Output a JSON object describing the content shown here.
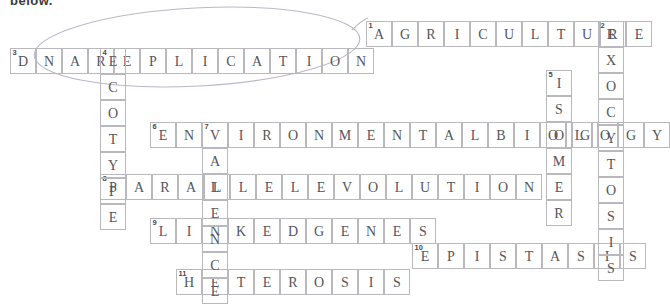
{
  "page": {
    "partial_heading": "below."
  },
  "grid": {
    "cell_size": 26,
    "border_color": "#b9b9bd",
    "letter_color": "#55555c",
    "number_color": "#4a4a50"
  },
  "annotation": {
    "type": "hand-drawn-ellipse",
    "stroke_color": "#b9b2c4",
    "target": "DNA REPLICATION"
  },
  "entries": [
    {
      "number": "1",
      "direction": "across",
      "answer": "AGRICULTURE",
      "letters": [
        "A",
        "G",
        "R",
        "I",
        "C",
        "U",
        "L",
        "T",
        "U",
        "R",
        "E"
      ],
      "x": 366,
      "y": 21
    },
    {
      "number": "3",
      "direction": "across",
      "answer": "DNAREPLICATION",
      "letters": [
        "D",
        "N",
        "A",
        "R",
        "E",
        "P",
        "L",
        "I",
        "C",
        "A",
        "T",
        "I",
        "O",
        "N"
      ],
      "x": 10,
      "y": 48
    },
    {
      "number": "6",
      "direction": "across",
      "answer": "ENVIRONMENTALBIOLOGY",
      "letters": [
        "E",
        "N",
        "V",
        "I",
        "R",
        "O",
        "N",
        "M",
        "E",
        "N",
        "T",
        "A",
        "L",
        "B",
        "I",
        "O",
        "L",
        "O",
        "G",
        "Y"
      ],
      "x": 150,
      "y": 122
    },
    {
      "number": "8",
      "direction": "across",
      "answer": "PARALLELEVOLUTION",
      "letters": [
        "P",
        "A",
        "R",
        "A",
        "L",
        "L",
        "E",
        "L",
        "E",
        "V",
        "O",
        "L",
        "U",
        "T",
        "I",
        "O",
        "N"
      ],
      "x": 100,
      "y": 174
    },
    {
      "number": "9",
      "direction": "across",
      "answer": "LINKEDGENES",
      "letters": [
        "L",
        "I",
        "N",
        "K",
        "E",
        "D",
        "G",
        "E",
        "N",
        "E",
        "S"
      ],
      "x": 150,
      "y": 218
    },
    {
      "number": "10",
      "direction": "across",
      "answer": "EPISTASIS",
      "letters": [
        "E",
        "P",
        "I",
        "S",
        "T",
        "A",
        "S",
        "I",
        "S"
      ],
      "x": 412,
      "y": 243
    },
    {
      "number": "11",
      "direction": "across",
      "answer": "HETEROSIS",
      "letters": [
        "H",
        "E",
        "T",
        "E",
        "R",
        "O",
        "S",
        "I",
        "S"
      ],
      "x": 176,
      "y": 269
    },
    {
      "number": "2",
      "direction": "down",
      "answer": "EXOCYTOSIS",
      "letters": [
        "E",
        "X",
        "O",
        "C",
        "Y",
        "T",
        "O",
        "S",
        "I",
        "S"
      ],
      "x": 598,
      "y": 21
    },
    {
      "number": "4",
      "direction": "down",
      "answer": "ECOTYPE",
      "letters": [
        "E",
        "C",
        "O",
        "T",
        "Y",
        "P",
        "E"
      ],
      "x": 100,
      "y": 48
    },
    {
      "number": "5",
      "direction": "down",
      "answer": "ISOMER",
      "letters": [
        "I",
        "S",
        "O",
        "M",
        "E",
        "R"
      ],
      "x": 546,
      "y": 70
    },
    {
      "number": "7",
      "direction": "down",
      "answer": "VALENCE",
      "letters": [
        "V",
        "A",
        "L",
        "E",
        "N",
        "C",
        "E"
      ],
      "x": 202,
      "y": 122
    }
  ],
  "extra_cells": [
    {
      "letter": "G",
      "x": 572,
      "y": 122
    }
  ]
}
